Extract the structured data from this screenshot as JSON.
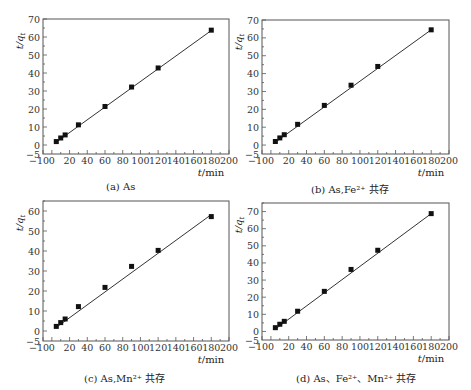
{
  "figure": {
    "panels": [
      {
        "id": "a",
        "caption": "(a) As"
      },
      {
        "id": "b",
        "caption": "(b) As,Fe²⁺ 共存"
      },
      {
        "id": "c",
        "caption": "(c) As,Mn²⁺ 共存"
      },
      {
        "id": "d",
        "caption": "(d) As、Fe²⁺、Mn²⁺ 共存"
      }
    ]
  },
  "chart_data": [
    {
      "type": "scatter",
      "title": "(a) As",
      "xlabel": "t/min",
      "ylabel": "t/q_t",
      "xlim": [
        -10,
        200
      ],
      "ylim": [
        -5,
        70
      ],
      "xticks": [
        -10,
        0,
        20,
        40,
        60,
        80,
        100,
        120,
        140,
        160,
        180,
        200
      ],
      "yticks": [
        -5,
        0,
        10,
        20,
        30,
        40,
        50,
        60,
        70
      ],
      "grid": false,
      "series": [
        {
          "name": "data",
          "marker": "square",
          "x": [
            5,
            10,
            15,
            30,
            60,
            90,
            120,
            180
          ],
          "y": [
            1.9,
            3.9,
            5.6,
            11.2,
            21.4,
            32.2,
            42.8,
            63.8
          ]
        },
        {
          "name": "fit",
          "style": "line",
          "x": [
            5,
            180
          ],
          "y": [
            1.6,
            63.6
          ]
        }
      ]
    },
    {
      "type": "scatter",
      "title": "(b) As,Fe²⁺ 共存",
      "xlabel": "t/min",
      "ylabel": "t/q_t",
      "xlim": [
        -10,
        200
      ],
      "ylim": [
        -5,
        70
      ],
      "xticks": [
        -10,
        0,
        20,
        40,
        60,
        80,
        100,
        120,
        140,
        160,
        180,
        200
      ],
      "yticks": [
        -5,
        0,
        10,
        20,
        30,
        40,
        50,
        60,
        70
      ],
      "grid": false,
      "series": [
        {
          "name": "data",
          "marker": "square",
          "x": [
            5,
            10,
            15,
            30,
            60,
            90,
            120,
            180
          ],
          "y": [
            2.0,
            4.0,
            5.8,
            11.6,
            22.2,
            33.5,
            44.0,
            64.5
          ]
        },
        {
          "name": "fit",
          "style": "line",
          "x": [
            5,
            180
          ],
          "y": [
            1.6,
            64.5
          ]
        }
      ]
    },
    {
      "type": "scatter",
      "title": "(c) As,Mn²⁺ 共存",
      "xlabel": "t/min",
      "ylabel": "t/q_t",
      "xlim": [
        -10,
        200
      ],
      "ylim": [
        -5,
        65
      ],
      "xticks": [
        -10,
        0,
        20,
        40,
        60,
        80,
        100,
        120,
        140,
        160,
        180,
        200
      ],
      "yticks": [
        -5,
        0,
        10,
        20,
        30,
        40,
        50,
        60
      ],
      "grid": false,
      "series": [
        {
          "name": "data",
          "marker": "square",
          "x": [
            5,
            10,
            15,
            30,
            60,
            90,
            120,
            180
          ],
          "y": [
            2.3,
            4.2,
            6.0,
            12.2,
            21.8,
            32.3,
            40.3,
            57.2
          ]
        },
        {
          "name": "fit",
          "style": "line",
          "x": [
            5,
            180
          ],
          "y": [
            1.8,
            58.2
          ]
        }
      ]
    },
    {
      "type": "scatter",
      "title": "(d) As、Fe²⁺、Mn²⁺ 共存",
      "xlabel": "t/min",
      "ylabel": "t/q_t",
      "xlim": [
        -10,
        200
      ],
      "ylim": [
        -5,
        75
      ],
      "xticks": [
        -10,
        0,
        20,
        40,
        60,
        80,
        100,
        120,
        140,
        160,
        180,
        200
      ],
      "yticks": [
        -5,
        0,
        10,
        20,
        30,
        40,
        50,
        60,
        70
      ],
      "grid": false,
      "series": [
        {
          "name": "data",
          "marker": "square",
          "x": [
            5,
            10,
            15,
            30,
            60,
            90,
            120,
            180
          ],
          "y": [
            2.2,
            4.2,
            5.9,
            11.8,
            23.4,
            36.2,
            47.4,
            68.8
          ]
        },
        {
          "name": "fit",
          "style": "line",
          "x": [
            5,
            180
          ],
          "y": [
            1.4,
            68.8
          ]
        }
      ]
    }
  ]
}
